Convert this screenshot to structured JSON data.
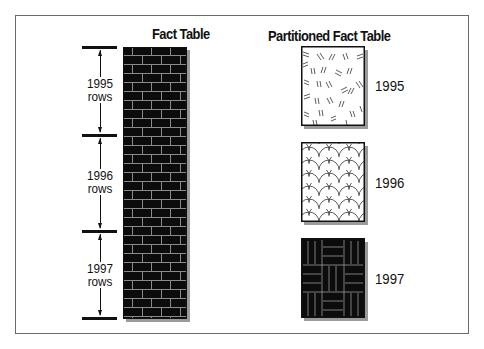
{
  "left": {
    "title": "Fact Table",
    "segments": [
      {
        "year": "1995",
        "unit": "rows"
      },
      {
        "year": "1996",
        "unit": "rows"
      },
      {
        "year": "1997",
        "unit": "rows"
      }
    ],
    "pattern": "brick-icon"
  },
  "right": {
    "title": "Partitioned Fact Table",
    "partitions": [
      {
        "year": "1995",
        "pattern": "dashes-pattern"
      },
      {
        "year": "1996",
        "pattern": "scales-pattern"
      },
      {
        "year": "1997",
        "pattern": "basketweave-pattern"
      }
    ]
  },
  "colors": {
    "ink": "#111111",
    "shadow": "#9a9a9a",
    "frame": "#6a6a6a",
    "mortar": "#8a8a8a"
  }
}
